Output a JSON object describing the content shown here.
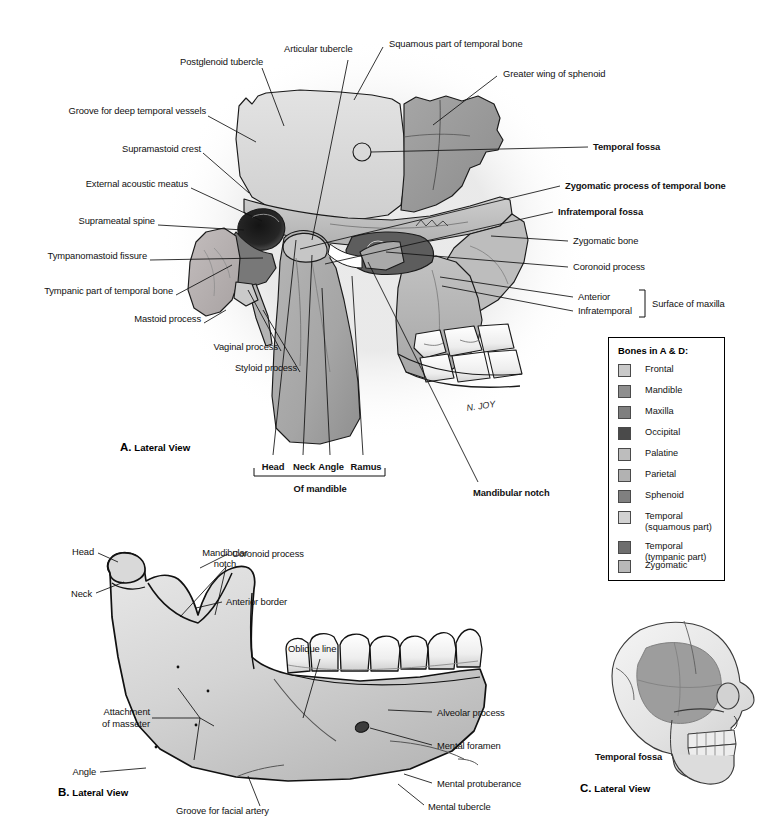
{
  "figure": {
    "artist_signature": "N. JOY"
  },
  "panels": [
    {
      "letter": "A.",
      "name": "Lateral View"
    },
    {
      "letter": "B.",
      "name": "Lateral View"
    },
    {
      "letter": "C.",
      "name": "Lateral View"
    }
  ],
  "panelA": {
    "labels_left": [
      {
        "text": "Postglenoid tubercle"
      },
      {
        "text": "Groove for deep temporal vessels"
      },
      {
        "text": "Supramastoid crest"
      },
      {
        "text": "External acoustic meatus"
      },
      {
        "text": "Suprameatal spine"
      },
      {
        "text": "Tympanomastoid fissure"
      },
      {
        "text": "Tympanic part of temporal bone"
      },
      {
        "text": "Mastoid process"
      },
      {
        "text": "Vaginal process"
      },
      {
        "text": "Styloid process"
      }
    ],
    "labels_top": [
      {
        "text": "Articular tubercle"
      },
      {
        "text": "Squamous part of temporal bone"
      },
      {
        "text": "Greater wing of sphenoid"
      }
    ],
    "labels_right": [
      {
        "text": "Temporal fossa",
        "bold": true
      },
      {
        "text": "Zygomatic process of temporal bone",
        "bold": true
      },
      {
        "text": "Infratemporal fossa",
        "bold": true
      },
      {
        "text": "Zygomatic bone",
        "bold": false
      },
      {
        "text": "Coronoid process",
        "bold": false
      },
      {
        "text": "Anterior",
        "bold": false
      },
      {
        "text": "Infratemporal",
        "bold": false
      }
    ],
    "bracket_right_label": "Surface of maxilla",
    "labels_bottom": [
      "Head",
      "Neck",
      "Angle",
      "Ramus"
    ],
    "bracket_bottom_label": "Of mandible",
    "label_mandibular_notch": "Mandibular notch"
  },
  "panelB": {
    "labels": [
      {
        "text": "Head"
      },
      {
        "text": "Mandibular\nnotch"
      },
      {
        "text": "Coronoid process"
      },
      {
        "text": "Neck"
      },
      {
        "text": "Anterior border"
      },
      {
        "text": "Oblique line"
      },
      {
        "text": "Attachment\nof masseter"
      },
      {
        "text": "Alveolar process"
      },
      {
        "text": "Mental foramen"
      },
      {
        "text": "Angle"
      },
      {
        "text": "Mental protuberance"
      },
      {
        "text": "Groove for facial artery"
      },
      {
        "text": "Mental tubercle"
      }
    ]
  },
  "panelC": {
    "label": "Temporal fossa"
  },
  "legend": {
    "title": "Bones in A & D:",
    "items": [
      {
        "label": "Frontal",
        "color": "#c9c9c9"
      },
      {
        "label": "Mandible",
        "color": "#8e8e8e"
      },
      {
        "label": "Maxilla",
        "color": "#7f7f7f"
      },
      {
        "label": "Occipital",
        "color": "#4a4a4a"
      },
      {
        "label": "Palatine",
        "color": "#bdbdbd"
      },
      {
        "label": "Parietal",
        "color": "#b2b2b2"
      },
      {
        "label": "Sphenoid",
        "color": "#808080"
      },
      {
        "label": "Temporal\n(squamous part)",
        "color": "#d2d2d2"
      },
      {
        "label": "Temporal\n(tympanic part)",
        "color": "#6e6e6e"
      },
      {
        "label": "Zygomatic",
        "color": "#b8b8b8"
      }
    ]
  },
  "colors": {
    "bone_light": "#dcdcdc",
    "bone_mid": "#b9b9b9",
    "bone_dark": "#9a9a9a",
    "mandible": "#a8a8a8",
    "tympanic": "#6e6e6e",
    "cavity": "#2a2a2a",
    "outline": "#1a1a1a",
    "tooth": "#f2f2f2",
    "background": "#ffffff",
    "fossa_shade": "#9d9d9d"
  }
}
